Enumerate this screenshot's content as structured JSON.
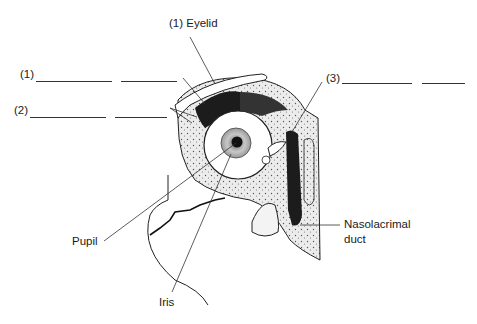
{
  "diagram": {
    "labels": {
      "eyelid": "(1) Eyelid",
      "blank1_prefix": "(1)",
      "blank2_prefix": "(2)",
      "blank3_prefix": "(3)",
      "pupil": "Pupil",
      "iris": "Iris",
      "nasolacrimal_line1": "Nasolacrimal",
      "nasolacrimal_line2": "duct"
    },
    "colors": {
      "ink": "#1a1a1a",
      "stipple_bg": "#e6e6e6",
      "dark_fill": "#202020",
      "white": "#ffffff"
    }
  }
}
